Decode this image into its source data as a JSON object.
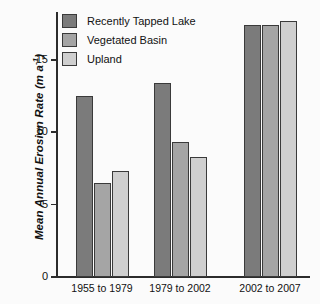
{
  "chart_data": {
    "type": "bar",
    "title": "",
    "xlabel": "",
    "ylabel": "Mean Annual Erosion Rate (m a-1)",
    "ylabel_main": "Mean Annual Erosion Rate (m a",
    "ylabel_sup": "-1",
    "ylabel_tail": ")",
    "categories": [
      "1955 to 1979",
      "1979 to 2002",
      "2002 to 2007"
    ],
    "series": [
      {
        "name": "Recently Tapped Lake",
        "color": "#7b7b7b",
        "values": [
          12.5,
          13.4,
          17.4
        ]
      },
      {
        "name": "Vegetated Basin",
        "color": "#a5a5a5",
        "values": [
          6.5,
          9.3,
          17.4
        ]
      },
      {
        "name": "Upland",
        "color": "#cfcfcf",
        "values": [
          7.3,
          8.3,
          17.7
        ]
      }
    ],
    "ylim": [
      0,
      18.3
    ],
    "yticks": [
      0,
      5,
      10,
      15
    ],
    "ytick_labels": [
      "0",
      "5",
      "10",
      "15"
    ],
    "grid": false,
    "legend_position": "top-left",
    "axis_color": "#2c2c2c"
  },
  "legend": {
    "items": [
      {
        "label": "Recently Tapped Lake",
        "color": "#7b7b7b"
      },
      {
        "label": "Vegetated Basin",
        "color": "#a5a5a5"
      },
      {
        "label": "Upland",
        "color": "#cfcfcf"
      }
    ]
  }
}
